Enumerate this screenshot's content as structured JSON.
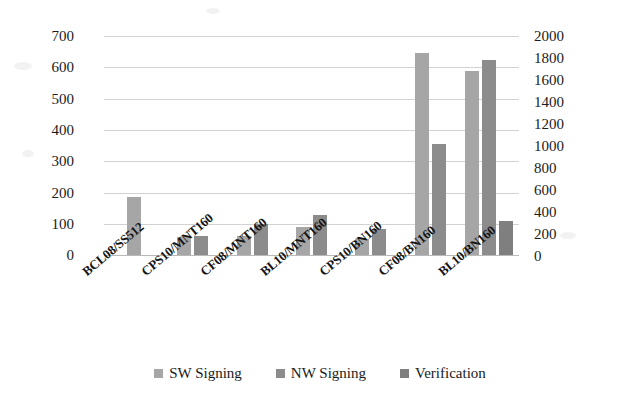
{
  "chart_data": {
    "type": "bar",
    "title": "",
    "subtitle": "",
    "xlabel": "",
    "ylabel": "",
    "y2label": "",
    "grid": true,
    "legend_position": "bottom",
    "categories": [
      "BCL08/SS512",
      "CPS10/MNT160",
      "CF08/MNT160",
      "BL10/MNT160",
      "CPS10/BN160",
      "CF08/BN160",
      "BL10/BN160"
    ],
    "series": [
      {
        "name": "SW Signing",
        "color": "#a6a6a6",
        "axis": "left",
        "values": [
          185,
          58,
          61,
          90,
          52,
          645,
          588
        ]
      },
      {
        "name": "NW Signing",
        "color": "#8c8c8c",
        "axis": "left",
        "values": [
          0,
          61,
          98,
          128,
          82,
          355,
          623
        ]
      },
      {
        "name": "Verification",
        "color": "#7f7f7f",
        "axis": "left",
        "values": [
          0,
          0,
          0,
          0,
          0,
          0,
          108
        ]
      }
    ],
    "ylim": [
      0,
      700
    ],
    "yticks": [
      0,
      100,
      200,
      300,
      400,
      500,
      600,
      700
    ],
    "ytick_labels": [
      "0",
      "100",
      "200",
      "300",
      "400",
      "500",
      "600",
      "700"
    ],
    "y2lim": [
      0,
      2000
    ],
    "y2ticks": [
      0,
      200,
      400,
      600,
      800,
      1000,
      1200,
      1400,
      1600,
      1800,
      2000
    ],
    "y2tick_labels": [
      "0",
      "200",
      "400",
      "600",
      "800",
      "1000",
      "1200",
      "1400",
      "1600",
      "1800",
      "2000"
    ],
    "bars": [
      {
        "category": "BCL08/SS512",
        "series": "SW Signing",
        "value": 185,
        "axis": "left"
      },
      {
        "category": "CPS10/MNT160",
        "series": "SW Signing",
        "value": 58,
        "axis": "left"
      },
      {
        "category": "CPS10/MNT160",
        "series": "NW Signing",
        "value": 61,
        "axis": "left"
      },
      {
        "category": "CF08/MNT160",
        "series": "SW Signing",
        "value": 90,
        "axis": "left"
      },
      {
        "category": "CF08/MNT160",
        "series": "NW Signing",
        "value": 98,
        "axis": "left"
      },
      {
        "category": "BL10/MNT160",
        "series": "SW Signing",
        "value": 90,
        "axis": "left"
      },
      {
        "category": "BL10/MNT160",
        "series": "NW Signing",
        "value": 128,
        "axis": "left"
      },
      {
        "category": "CPS10/BN160",
        "series": "SW Signing",
        "value": 52,
        "axis": "left"
      },
      {
        "category": "CPS10/BN160",
        "series": "NW Signing",
        "value": 82,
        "axis": "left"
      },
      {
        "category": "CF08/BN160",
        "series": "SW Signing",
        "value": 645,
        "axis": "left"
      },
      {
        "category": "CF08/BN160",
        "series": "NW Signing",
        "value": 355,
        "axis": "left"
      },
      {
        "category": "BL10/BN160",
        "series": "SW Signing",
        "value": 588,
        "axis": "left"
      },
      {
        "category": "BL10/BN160",
        "series": "NW Signing",
        "value": 623,
        "axis": "left"
      },
      {
        "category": "BL10/BN160",
        "series": "Verification",
        "value": 108,
        "axis": "left"
      }
    ]
  },
  "axes": {
    "left": {
      "name": "primary-value-axis",
      "labels": [
        "700",
        "600",
        "500",
        "400",
        "300",
        "200",
        "100",
        "0"
      ]
    },
    "right": {
      "name": "secondary-value-axis",
      "labels": [
        "2000",
        "1800",
        "1600",
        "1400",
        "1200",
        "1000",
        "800",
        "600",
        "400",
        "200",
        "0"
      ]
    }
  },
  "categories": [
    {
      "label": "BCL08/SS512"
    },
    {
      "label": "CPS10/MNT160"
    },
    {
      "label": "CF08/MNT160"
    },
    {
      "label": "BL10/MNT160"
    },
    {
      "label": "CPS10/BN160"
    },
    {
      "label": "CF08/BN160"
    },
    {
      "label": "BL10/BN160"
    }
  ],
  "legend": {
    "items": [
      {
        "label": "SW Signing",
        "color": "#a6a6a6"
      },
      {
        "label": "NW Signing",
        "color": "#8c8c8c"
      },
      {
        "label": "Verification",
        "color": "#7f7f7f"
      }
    ]
  },
  "colors": {
    "sw_signing": "#a6a6a6",
    "nw_signing": "#8c8c8c",
    "verification": "#7f7f7f",
    "gridline": "#d2d2d2",
    "text": "#1a1a1a",
    "background": "#ffffff"
  }
}
